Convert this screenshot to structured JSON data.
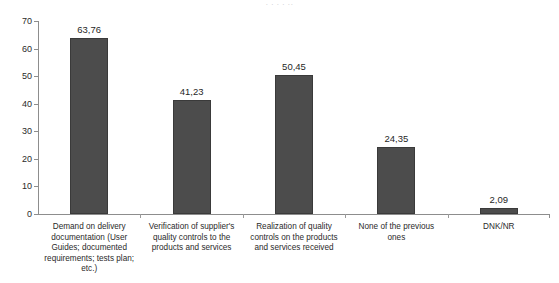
{
  "top_clipped_text": "· ·    ·    · ··",
  "chart_data": {
    "type": "bar",
    "title": "",
    "subtitle": "",
    "xlabel": "",
    "ylabel": "",
    "ylim": [
      0,
      70
    ],
    "ytick_step": 10,
    "grid": false,
    "legend": false,
    "decimal_separator": ",",
    "bar_color": "#4c4c4c",
    "bar_edge_color": "#3a3a3a",
    "axis_color": "#8d8d8d",
    "categories": [
      "Demand on delivery documentation (User Guides; documented requirements; tests plan; etc.)",
      "Verification of supplier's quality controls to the products and services",
      "Realization of quality controls on the products and services received",
      "None of the previous ones",
      "DNK/NR"
    ],
    "category_labels_wrapped": [
      "Demand on delivery\ndocumentation (User\nGuides; documented\nrequirements; tests plan;\netc.)",
      "Verification of supplier's\nquality controls to the\nproducts and services",
      "Realization of quality\ncontrols on the products\nand services received",
      "None of the previous\nones",
      "DNK/NR"
    ],
    "values": [
      63.76,
      41.23,
      50.45,
      24.35,
      2.09
    ],
    "value_labels": [
      "63,76",
      "41,23",
      "50,45",
      "24,35",
      "2,09"
    ],
    "ytick_labels": [
      "0",
      "10",
      "20",
      "30",
      "40",
      "50",
      "60",
      "70"
    ],
    "ytick_values": [
      0,
      10,
      20,
      30,
      40,
      50,
      60,
      70
    ]
  }
}
